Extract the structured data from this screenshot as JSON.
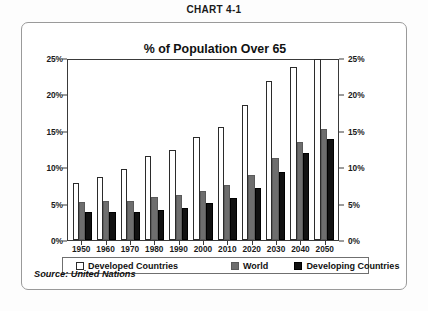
{
  "caption": {
    "prefix": "C",
    "small_caps": "HART",
    "number": " 4-1",
    "full": "CHART 4-1"
  },
  "frame": {
    "source_note": "Source: United Nations"
  },
  "legend": {
    "items": [
      {
        "label": "Developed Countries",
        "swatch": "white-outline",
        "color": "#ffffff"
      },
      {
        "label": "World",
        "swatch": "gray-fill",
        "color": "#6e6e6e"
      },
      {
        "label": "Developing Countries",
        "swatch": "black-fill",
        "color": "#111111"
      }
    ]
  },
  "chart_data": {
    "type": "bar",
    "title": "% of Population Over 65",
    "xlabel": "",
    "ylabel": "",
    "ylim": [
      0,
      25
    ],
    "ytick_labels": [
      "0%",
      "5%",
      "10%",
      "15%",
      "20%",
      "25%"
    ],
    "ytick_values": [
      0,
      5,
      10,
      15,
      20,
      25
    ],
    "dual_y_axis": true,
    "grid": false,
    "legend_position": "bottom",
    "categories": [
      "1950",
      "1960",
      "1970",
      "1980",
      "1990",
      "2000",
      "2010",
      "2020",
      "2030",
      "2040",
      "2050"
    ],
    "series": [
      {
        "name": "Developed Countries",
        "color": "#ffffff",
        "values": [
          7.9,
          8.6,
          9.8,
          11.5,
          12.4,
          14.2,
          15.5,
          18.5,
          21.9,
          23.7,
          24.9
        ]
      },
      {
        "name": "World",
        "color": "#6e6e6e",
        "values": [
          5.2,
          5.3,
          5.4,
          5.9,
          6.2,
          6.8,
          7.6,
          8.9,
          11.2,
          13.4,
          15.2
        ]
      },
      {
        "name": "Developing Countries",
        "color": "#111111",
        "values": [
          3.9,
          3.9,
          3.8,
          4.1,
          4.4,
          5.1,
          5.8,
          7.2,
          9.4,
          11.9,
          13.9
        ]
      }
    ]
  }
}
